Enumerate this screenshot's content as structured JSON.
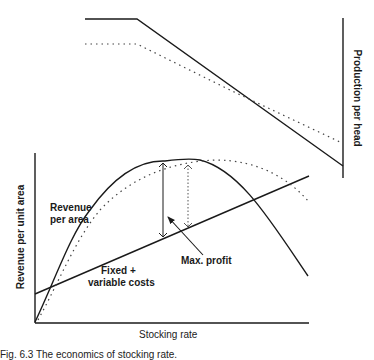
{
  "figure": {
    "top_panel": {
      "y_axis_label": "Production per head",
      "series": [
        {
          "name": "production-solid",
          "style": "solid",
          "points": [
            [
              85,
              19
            ],
            [
              137,
              19
            ],
            [
              342,
              166
            ]
          ]
        },
        {
          "name": "production-dotted",
          "style": "dotted",
          "points": [
            [
              85,
              44
            ],
            [
              137,
              44
            ],
            [
              340,
              142
            ]
          ]
        }
      ]
    },
    "bottom_panel": {
      "y_axis_label": "Revenue per unit area",
      "x_axis_label": "Stocking rate",
      "revenue_label_line1": "Revenue",
      "revenue_label_line2": "per area",
      "cost_label_line1": "Fixed +",
      "cost_label_line2": "variable costs",
      "max_profit_label": "Max. profit"
    },
    "caption": "Fig. 6.3  The economics of stocking rate."
  },
  "colors": {
    "ink": "#1a1a1a",
    "dotted": "#444444",
    "background": "#ffffff"
  }
}
